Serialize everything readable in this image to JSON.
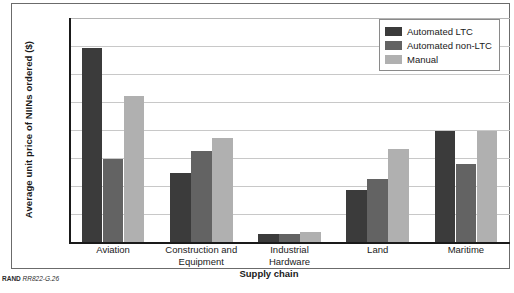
{
  "figure": {
    "source_note_prefix": "RAND",
    "source_note_id": "RR822-G.26"
  },
  "legend": {
    "position": "top-right",
    "items": [
      {
        "label": "Automated LTC",
        "color": "#3b3b3b"
      },
      {
        "label": "Automated non-LTC",
        "color": "#636363"
      },
      {
        "label": "Manual",
        "color": "#b0b0b0"
      }
    ]
  },
  "axes": {
    "y_title": "Average unit price of NIINs ordered ($)",
    "x_title": "Supply chain",
    "y_ticks": [
      "0",
      "200",
      "400",
      "600",
      "800",
      "1,000",
      "1,200",
      "1,400",
      "1,600"
    ]
  },
  "chart_data": {
    "type": "bar",
    "title": "",
    "subtitle": "",
    "xlabel": "Supply chain",
    "ylabel": "Average unit price of NIINs ordered ($)",
    "ylim": [
      0,
      1600
    ],
    "ytick_step": 200,
    "grid": true,
    "legend_position": "top-right",
    "categories": [
      "Aviation",
      "Construction and Equipment",
      "Industrial Hardware",
      "Land",
      "Maritime"
    ],
    "category_lines": [
      [
        "Aviation"
      ],
      [
        "Construction and",
        "Equipment"
      ],
      [
        "Industrial",
        "Hardware"
      ],
      [
        "Land"
      ],
      [
        "Maritime"
      ]
    ],
    "series": [
      {
        "name": "Automated LTC",
        "color": "#3b3b3b",
        "values": [
          1385,
          490,
          60,
          375,
          795
        ]
      },
      {
        "name": "Automated non-LTC",
        "color": "#636363",
        "values": [
          595,
          650,
          60,
          450,
          555
        ]
      },
      {
        "name": "Manual",
        "color": "#b0b0b0",
        "values": [
          1045,
          745,
          75,
          665,
          795
        ]
      }
    ]
  }
}
